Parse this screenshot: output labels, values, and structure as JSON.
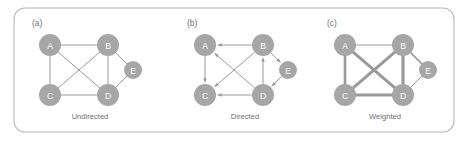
{
  "figure": {
    "frame": {
      "x": 14,
      "y": 8,
      "width": 440,
      "height": 124,
      "radius": 11,
      "stroke_color": "#b8b8b8"
    },
    "background_color": "#ffffff",
    "node_color": "#a6a6a6",
    "node_label_color": "#ffffff",
    "edge_color": "#9a9a9a",
    "text_color": "#6f6f6f"
  },
  "panels": [
    {
      "id": "panel-a",
      "label": "(a)",
      "label_x": 32,
      "label_y": 26,
      "caption": "Undirected",
      "caption_x": 90,
      "caption_y": 119,
      "graph_type": "undirected",
      "nodes": [
        {
          "id": "A",
          "label": "A",
          "cx": 50,
          "cy": 45,
          "r": 11
        },
        {
          "id": "B",
          "label": "B",
          "cx": 108,
          "cy": 45,
          "r": 11
        },
        {
          "id": "C",
          "label": "C",
          "cx": 50,
          "cy": 95,
          "r": 11
        },
        {
          "id": "D",
          "label": "D",
          "cx": 108,
          "cy": 95,
          "r": 11
        },
        {
          "id": "E",
          "label": "E",
          "cx": 133,
          "cy": 70,
          "r": 9
        }
      ],
      "edges": [
        {
          "from": "A",
          "to": "B",
          "width": 1.0
        },
        {
          "from": "A",
          "to": "C",
          "width": 1.0
        },
        {
          "from": "A",
          "to": "D",
          "width": 1.0
        },
        {
          "from": "B",
          "to": "C",
          "width": 1.0
        },
        {
          "from": "B",
          "to": "D",
          "width": 1.0
        },
        {
          "from": "C",
          "to": "D",
          "width": 1.0
        },
        {
          "from": "B",
          "to": "E",
          "width": 1.0
        },
        {
          "from": "D",
          "to": "E",
          "width": 1.0
        }
      ]
    },
    {
      "id": "panel-b",
      "label": "(b)",
      "label_x": 187,
      "label_y": 26,
      "caption": "Directed",
      "caption_x": 245,
      "caption_y": 119,
      "graph_type": "directed",
      "nodes": [
        {
          "id": "A",
          "label": "A",
          "cx": 205,
          "cy": 45,
          "r": 11
        },
        {
          "id": "B",
          "label": "B",
          "cx": 263,
          "cy": 45,
          "r": 11
        },
        {
          "id": "C",
          "label": "C",
          "cx": 205,
          "cy": 95,
          "r": 11
        },
        {
          "id": "D",
          "label": "D",
          "cx": 263,
          "cy": 95,
          "r": 11
        },
        {
          "id": "E",
          "label": "E",
          "cx": 288,
          "cy": 70,
          "r": 9
        }
      ],
      "edges": [
        {
          "from": "B",
          "to": "A",
          "width": 1.0
        },
        {
          "from": "A",
          "to": "C",
          "width": 1.0
        },
        {
          "from": "D",
          "to": "A",
          "width": 1.0
        },
        {
          "from": "B",
          "to": "C",
          "width": 1.0
        },
        {
          "from": "D",
          "to": "B",
          "width": 1.0
        },
        {
          "from": "D",
          "to": "C",
          "width": 1.0
        },
        {
          "from": "B",
          "to": "E",
          "width": 1.0
        },
        {
          "from": "E",
          "to": "D",
          "width": 1.0
        }
      ]
    },
    {
      "id": "panel-c",
      "label": "(c)",
      "label_x": 327,
      "label_y": 26,
      "caption": "Weighted",
      "caption_x": 385,
      "caption_y": 119,
      "graph_type": "weighted",
      "nodes": [
        {
          "id": "A",
          "label": "A",
          "cx": 345,
          "cy": 45,
          "r": 11
        },
        {
          "id": "B",
          "label": "B",
          "cx": 403,
          "cy": 45,
          "r": 11
        },
        {
          "id": "C",
          "label": "C",
          "cx": 345,
          "cy": 95,
          "r": 11
        },
        {
          "id": "D",
          "label": "D",
          "cx": 403,
          "cy": 95,
          "r": 11
        },
        {
          "id": "E",
          "label": "E",
          "cx": 428,
          "cy": 70,
          "r": 9
        }
      ],
      "edges": [
        {
          "from": "A",
          "to": "B",
          "width": 1.0
        },
        {
          "from": "A",
          "to": "C",
          "width": 2.6
        },
        {
          "from": "A",
          "to": "D",
          "width": 3.0
        },
        {
          "from": "B",
          "to": "C",
          "width": 3.0
        },
        {
          "from": "B",
          "to": "D",
          "width": 3.2
        },
        {
          "from": "C",
          "to": "D",
          "width": 3.2
        },
        {
          "from": "B",
          "to": "E",
          "width": 1.6
        },
        {
          "from": "D",
          "to": "E",
          "width": 1.0
        }
      ]
    }
  ]
}
